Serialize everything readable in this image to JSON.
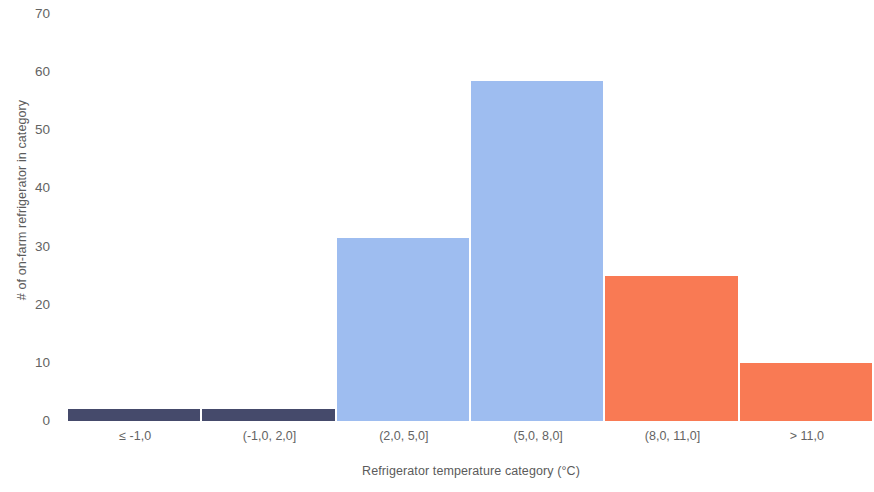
{
  "chart_data": {
    "type": "bar",
    "title": "",
    "subtitle": "",
    "xlabel": "Refrigerator temperature category (°C)",
    "ylabel": "# of on-farm refrigerator in category",
    "categories": [
      "≤ -1,0",
      "(-1,0, 2,0]",
      "(2,0, 5,0]",
      "(5,0, 8,0]",
      "(8,0, 11,0]",
      "> 11,0"
    ],
    "values": [
      2,
      2,
      31.5,
      58.5,
      25,
      10
    ],
    "bar_colors": [
      "#454a6b",
      "#454a6b",
      "#9ebdf0",
      "#9ebdf0",
      "#f97a54",
      "#f97a54"
    ],
    "ylim": [
      0,
      70
    ],
    "yticks": [
      0,
      10,
      20,
      30,
      40,
      50,
      60,
      70
    ],
    "ytick_labels": [
      "0",
      "10",
      "20",
      "30",
      "40",
      "50",
      "60",
      "70"
    ],
    "xlim_categories": 6,
    "grid": false,
    "legend": null,
    "legend_position": "none",
    "annotations": [],
    "axis_line": false,
    "bar_gap_px": 2
  },
  "colors": {
    "background": "#ffffff",
    "dark_navy": "#454a6b",
    "light_blue": "#9ebdf0",
    "orange": "#f97a54",
    "tick_text": "#636363",
    "axis_title_text": "#5b5b5b"
  }
}
